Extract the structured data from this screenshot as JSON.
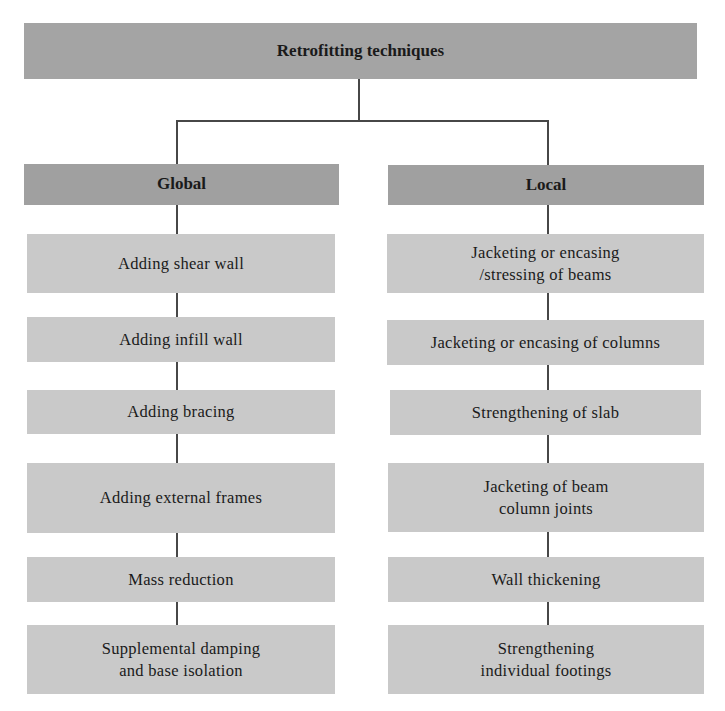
{
  "diagram": {
    "root": {
      "label": "Retrofitting techniques"
    },
    "branches": [
      {
        "label": "Global",
        "items": [
          {
            "label": "Adding shear wall"
          },
          {
            "label": "Adding infill wall"
          },
          {
            "label": "Adding bracing"
          },
          {
            "label": "Adding external frames"
          },
          {
            "label": "Mass reduction"
          },
          {
            "label": "Supplemental damping\nand base isolation"
          }
        ]
      },
      {
        "label": "Local",
        "items": [
          {
            "label": "Jacketing or encasing\n/stressing of beams"
          },
          {
            "label": "Jacketing or encasing of columns"
          },
          {
            "label": "Strengthening of slab"
          },
          {
            "label": "Jacketing of beam\ncolumn joints"
          },
          {
            "label": "Wall thickening"
          },
          {
            "label": "Strengthening\nindividual footings"
          }
        ]
      }
    ]
  },
  "colors": {
    "root_fill": "#a4a4a4",
    "branch_header_fill": "#a0a0a0",
    "item_fill": "#c9c9c9",
    "connector": "#474747"
  }
}
